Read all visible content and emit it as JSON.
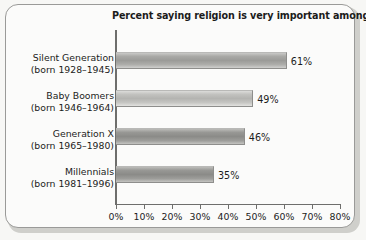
{
  "chart_data": {
    "type": "bar",
    "orientation": "horizontal",
    "title": "Percent saying religion is very important among…",
    "xlabel": "",
    "ylabel": "",
    "categories": [
      "Silent Generation (born 1928–1945)",
      "Baby Boomers (born 1946–1964)",
      "Generation X (born 1965–1980)",
      "Millennials (born 1981–1996)"
    ],
    "values": [
      61,
      49,
      46,
      35
    ],
    "value_labels": [
      "61%",
      "49%",
      "46%",
      "35%"
    ],
    "xlim": [
      0,
      80
    ],
    "xticks": [
      0,
      10,
      20,
      30,
      40,
      50,
      60,
      70,
      80
    ],
    "xtick_labels": [
      "0%",
      "10%",
      "20%",
      "30%",
      "40%",
      "50%",
      "60%",
      "70%",
      "80%"
    ],
    "grid": false,
    "legend": false,
    "series": [
      {
        "name": "Percent saying religion is very important",
        "values": [
          61,
          49,
          46,
          35
        ]
      }
    ]
  },
  "figure": {
    "title": "Percent saying religion is very important among…",
    "rows": [
      {
        "line1": "Silent Generation",
        "line2": "(born 1928–1945)",
        "value_label": "61%"
      },
      {
        "line1": "Baby Boomers",
        "line2": "(born 1946–1964)",
        "value_label": "49%"
      },
      {
        "line1": "Generation X",
        "line2": "(born 1965–1980)",
        "value_label": "46%"
      },
      {
        "line1": "Millennials",
        "line2": "(born 1981–1996)",
        "value_label": "35%"
      }
    ],
    "axis": {
      "tick_labels": [
        "0%",
        "10%",
        "20%",
        "30%",
        "40%",
        "50%",
        "60%",
        "70%",
        "80%"
      ]
    },
    "colors": {
      "bar_mid": "#9b9b98",
      "bar_dark": "#8b8b88",
      "bar_light": "#b4b4b1",
      "axis": "#6e6e6c",
      "text": "#1b1b1b",
      "frame": "#9a9a98",
      "background": "#fbfbfa"
    }
  }
}
